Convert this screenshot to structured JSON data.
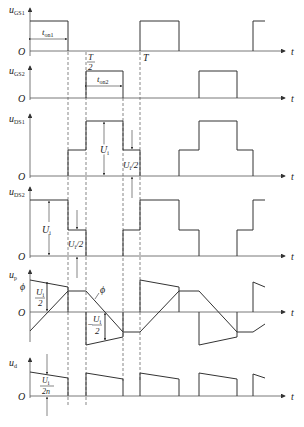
{
  "figure": {
    "type": "timing-diagram",
    "time_axis_label": "t",
    "origin_label": "O",
    "markers": {
      "half_period": "T/2",
      "period": "T"
    },
    "dashed_verticals_x": [
      68,
      86,
      123,
      140
    ]
  },
  "panels": [
    {
      "id": "uGS1",
      "label_main": "u",
      "label_sub": "GS1",
      "annotations": [
        {
          "text_main": "t",
          "text_sub": "on1"
        }
      ]
    },
    {
      "id": "uGS2",
      "label_main": "u",
      "label_sub": "GS2",
      "annotations": [
        {
          "text_main": "t",
          "text_sub": "on2"
        }
      ]
    },
    {
      "id": "uDS1",
      "label_main": "u",
      "label_sub": "DS1",
      "annotations": [
        {
          "text": "U"
        },
        {
          "text_sub": "i"
        },
        {
          "text": "U"
        },
        {
          "text_sub2": "i/2"
        }
      ]
    },
    {
      "id": "uDS2",
      "label_main": "u",
      "label_sub": "DS2"
    },
    {
      "id": "up",
      "label_main": "u",
      "label_sub": "p",
      "annotations": [
        {
          "text": "ϕ"
        }
      ]
    },
    {
      "id": "ud",
      "label_main": "u",
      "label_sub": "d"
    }
  ],
  "labels": {
    "t": "t",
    "O": "O",
    "T": "T",
    "two": "2",
    "ton1_main": "t",
    "ton1_sub": "on1",
    "ton2_main": "t",
    "ton2_sub": "on2",
    "Ui_main": "U",
    "Ui_sub": "i",
    "Ui2_slash": "/2",
    "phi": "ϕ",
    "minus": "−",
    "two_n": "2n",
    "u": "u",
    "GS1": "GS1",
    "GS2": "GS2",
    "DS1": "DS1",
    "DS2": "DS2",
    "p": "p",
    "d": "d"
  }
}
